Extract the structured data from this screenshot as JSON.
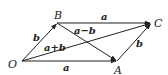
{
  "diagram": {
    "points": {
      "O": {
        "label": "O",
        "x": 22,
        "y": 61
      },
      "A": {
        "label": "A",
        "x": 117,
        "y": 61
      },
      "B": {
        "label": "B",
        "x": 57,
        "y": 23
      },
      "C": {
        "label": "C",
        "x": 151,
        "y": 23
      }
    },
    "vectors": [
      {
        "from": "O",
        "to": "A",
        "label": "a"
      },
      {
        "from": "O",
        "to": "B",
        "label": "b"
      },
      {
        "from": "B",
        "to": "C",
        "label": "a"
      },
      {
        "from": "A",
        "to": "C",
        "label": "b"
      },
      {
        "from": "O",
        "to": "C",
        "label": "a+b"
      },
      {
        "from": "B",
        "to": "A",
        "label": "a−b"
      }
    ],
    "stroke_color": "#222222"
  }
}
